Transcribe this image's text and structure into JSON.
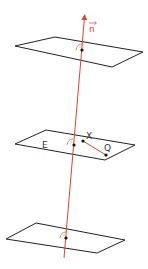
{
  "diagram": {
    "colors": {
      "plane_stroke": "#222222",
      "normal_line": "#e0442a",
      "point": "#111111",
      "segment": "#d04a2e",
      "angle_mark": "#e07040",
      "label": "#333333"
    },
    "labels": {
      "normal_vector": "n",
      "plane": "E",
      "point_x": "X",
      "point_q": "Q"
    },
    "planes": [
      {
        "name": "top-plane",
        "points": "15,46 55,37 143,52 112,67"
      },
      {
        "name": "middle-plane",
        "points": "15,144 46,130 135,145 105,160"
      },
      {
        "name": "bottom-plane",
        "points": "6,239 36,223 125,240 97,253"
      }
    ]
  }
}
